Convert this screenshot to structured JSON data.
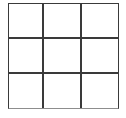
{
  "figure": {
    "type": "grid",
    "rows": 3,
    "columns": 3,
    "cell_count": 9,
    "colors": {
      "line": "#3a3a3a",
      "bottom_edge_line": "#8d8d8d",
      "cell_fill": "#ffffff",
      "background": "#ffffff"
    },
    "cells": [
      {
        "id": "r1c1",
        "label": ""
      },
      {
        "id": "r1c2",
        "label": ""
      },
      {
        "id": "r1c3",
        "label": ""
      },
      {
        "id": "r2c1",
        "label": ""
      },
      {
        "id": "r2c2",
        "label": ""
      },
      {
        "id": "r2c3",
        "label": ""
      },
      {
        "id": "r3c1",
        "label": ""
      },
      {
        "id": "r3c2",
        "label": ""
      },
      {
        "id": "r3c3",
        "label": ""
      }
    ]
  }
}
